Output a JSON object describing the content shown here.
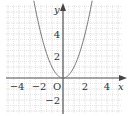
{
  "chart_data": {
    "type": "line",
    "title": "",
    "xlabel": "x",
    "ylabel": "y",
    "origin_label": "O",
    "function": "y = x^2",
    "xlim": [
      -5,
      5
    ],
    "ylim": [
      -3,
      6.5
    ],
    "grid": true,
    "x_ticks": [
      {
        "value": -4,
        "label": "−4"
      },
      {
        "value": -2,
        "label": "−2"
      },
      {
        "value": 2,
        "label": "2"
      },
      {
        "value": 4,
        "label": "4"
      }
    ],
    "y_ticks": [
      {
        "value": 4,
        "label": "4"
      },
      {
        "value": 2,
        "label": "2"
      },
      {
        "value": -2,
        "label": "−2"
      }
    ],
    "series": [
      {
        "name": "parabola",
        "x": [
          -2.5,
          -2,
          -1.5,
          -1,
          -0.5,
          0,
          0.5,
          1,
          1.5,
          2,
          2.5
        ],
        "y": [
          6.25,
          4,
          2.25,
          1,
          0.25,
          0,
          0.25,
          1,
          2.25,
          4,
          6.25
        ]
      }
    ],
    "colors": {
      "curve": "#777777",
      "axes": "#555555",
      "grid": "#cccccc"
    }
  }
}
